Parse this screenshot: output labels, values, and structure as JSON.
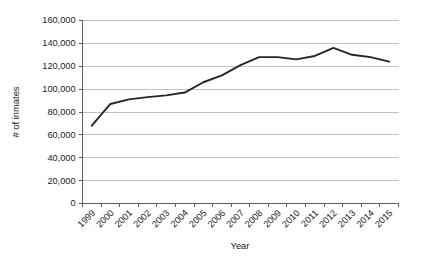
{
  "chart_data": {
    "type": "line",
    "title": "",
    "xlabel": "Year",
    "ylabel": "# of inmates",
    "categories": [
      "1999",
      "2000",
      "2001",
      "2002",
      "2003",
      "2004",
      "2005",
      "2006",
      "2007",
      "2008",
      "2009",
      "2010",
      "2011",
      "2012",
      "2013",
      "2014",
      "2015"
    ],
    "values": [
      68000,
      87000,
      91000,
      93000,
      94500,
      97000,
      106000,
      112000,
      121000,
      128000,
      128000,
      126000,
      129000,
      136000,
      130000,
      128000,
      124000
    ],
    "series": [
      {
        "name": "# of inmates",
        "values": [
          68000,
          87000,
          91000,
          93000,
          94500,
          97000,
          106000,
          112000,
          121000,
          128000,
          128000,
          126000,
          129000,
          136000,
          130000,
          128000,
          124000
        ]
      }
    ],
    "ylim": [
      0,
      160000
    ],
    "ytick_labels": [
      "0",
      "20,000",
      "40,000",
      "60,000",
      "80,000",
      "100,000",
      "120,000",
      "140,000",
      "160,000"
    ],
    "ytick_values": [
      0,
      20000,
      40000,
      60000,
      80000,
      100000,
      120000,
      140000,
      160000
    ],
    "xtick_labels": [
      "1999",
      "2000",
      "2001",
      "2002",
      "2003",
      "2004",
      "2005",
      "2006",
      "2007",
      "2008",
      "2009",
      "2010",
      "2011",
      "2012",
      "2013",
      "2014",
      "2015"
    ],
    "grid": true,
    "grid_axis": "y",
    "legend": false,
    "legend_position": "none",
    "line_color": "#262626",
    "grid_color": "#a6a6a6",
    "axis_color": "#4d4d4d",
    "background_color": "#ffffff",
    "xtick_label_rotation": -45
  }
}
